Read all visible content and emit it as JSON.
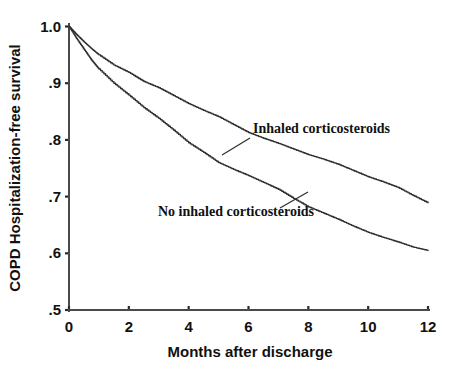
{
  "chart_data": {
    "type": "line",
    "title": "",
    "xlabel": "Months after discharge",
    "ylabel": "COPD Hospitalization-free survival",
    "xlim": [
      0,
      12
    ],
    "ylim": [
      0.5,
      1.0
    ],
    "grid": false,
    "legend_position": "inline-annotation",
    "xticks": [
      0,
      2,
      4,
      6,
      8,
      10,
      12
    ],
    "xtick_labels": [
      "0",
      "2",
      "4",
      "6",
      "8",
      "10",
      "12"
    ],
    "yticks": [
      0.5,
      0.6,
      0.7,
      0.8,
      0.9,
      1.0
    ],
    "ytick_labels": [
      ".5",
      ".6",
      ".7",
      ".8",
      ".9",
      "1.0"
    ],
    "x": [
      0,
      0.25,
      0.5,
      0.75,
      1,
      1.5,
      2,
      2.5,
      3,
      3.5,
      4,
      4.5,
      5,
      5.5,
      6,
      6.5,
      7,
      7.5,
      8,
      8.5,
      9,
      9.5,
      10,
      10.5,
      11,
      11.5,
      12
    ],
    "series": [
      {
        "name": "Inhaled corticosteroids",
        "label": "Inhaled corticosteroids",
        "color": "#2e2e2e",
        "label_x": 253,
        "label_y": 133,
        "values": [
          1.0,
          0.986,
          0.973,
          0.961,
          0.95,
          0.932,
          0.919,
          0.903,
          0.892,
          0.878,
          0.864,
          0.852,
          0.841,
          0.827,
          0.813,
          0.803,
          0.794,
          0.784,
          0.774,
          0.766,
          0.757,
          0.746,
          0.735,
          0.726,
          0.716,
          0.702,
          0.689
        ]
      },
      {
        "name": "No inhaled corticosteroids",
        "label": "No inhaled corticosteroids",
        "color": "#2e2e2e",
        "label_x": 158,
        "label_y": 216,
        "values": [
          1.0,
          0.979,
          0.96,
          0.941,
          0.925,
          0.9,
          0.879,
          0.857,
          0.838,
          0.817,
          0.795,
          0.778,
          0.76,
          0.748,
          0.737,
          0.725,
          0.713,
          0.697,
          0.682,
          0.671,
          0.66,
          0.648,
          0.637,
          0.628,
          0.62,
          0.611,
          0.605
        ]
      }
    ]
  },
  "axes": {
    "origin_px": {
      "x": 69,
      "y": 310
    },
    "x_max_px": 428,
    "y_top_px": 26.5
  }
}
